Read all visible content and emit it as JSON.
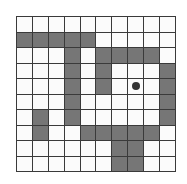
{
  "grid": {
    "rows": 10,
    "cols": 10,
    "colors": {
      "empty": "#fbfbfb",
      "wall": "#767676",
      "line": "#3a3a3a",
      "agent": "#333333"
    },
    "cells": [
      [
        0,
        0,
        0,
        0,
        0,
        0,
        0,
        0,
        0,
        0
      ],
      [
        1,
        1,
        1,
        1,
        1,
        0,
        0,
        0,
        0,
        0
      ],
      [
        0,
        0,
        0,
        1,
        0,
        1,
        1,
        1,
        1,
        0
      ],
      [
        0,
        0,
        0,
        1,
        0,
        1,
        0,
        0,
        0,
        1
      ],
      [
        0,
        0,
        0,
        1,
        0,
        1,
        0,
        0,
        0,
        1
      ],
      [
        0,
        0,
        0,
        1,
        0,
        0,
        0,
        0,
        0,
        1
      ],
      [
        0,
        1,
        0,
        1,
        0,
        0,
        0,
        0,
        0,
        1
      ],
      [
        0,
        1,
        0,
        0,
        1,
        1,
        1,
        1,
        1,
        0
      ],
      [
        0,
        0,
        0,
        0,
        0,
        0,
        1,
        1,
        0,
        0
      ],
      [
        0,
        0,
        0,
        0,
        0,
        0,
        1,
        1,
        0,
        0
      ]
    ],
    "agent": {
      "row": 4,
      "col": 7
    }
  }
}
